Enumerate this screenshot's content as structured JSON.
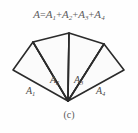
{
  "figure": {
    "caption": "(c)",
    "background_color": "#fefefe",
    "stroke_color": "#2b2b2b",
    "fill_color": "#fbfbfb",
    "text_color": "#5a5a5a"
  },
  "equation": {
    "full_text": "A=A1+A2+A3+A4",
    "lhs": "A",
    "equals": "=",
    "terms": [
      {
        "base": "A",
        "sub": "1"
      },
      {
        "base": "A",
        "sub": "2"
      },
      {
        "base": "A",
        "sub": "3"
      },
      {
        "base": "A",
        "sub": "4"
      }
    ],
    "plus": "+"
  },
  "regions": [
    {
      "base": "A",
      "sub": "1",
      "name": "triangle-a1"
    },
    {
      "base": "A",
      "sub": "2",
      "name": "triangle-a2"
    },
    {
      "base": "A",
      "sub": "3",
      "name": "triangle-a3"
    },
    {
      "base": "A",
      "sub": "4",
      "name": "triangle-a4"
    }
  ],
  "geometry": {
    "apex": "68,77",
    "vertices": {
      "left": "13,46",
      "upper_left": "33,18",
      "top": "69,9",
      "upper_right": "104,20",
      "right": "124,46"
    },
    "triangles": [
      {
        "id": "A1",
        "points": "68,77 13,46 33,18"
      },
      {
        "id": "A2",
        "points": "68,77 33,18 69,9"
      },
      {
        "id": "A3",
        "points": "68,77 69,9 104,20"
      },
      {
        "id": "A4",
        "points": "68,77 104,20 124,46"
      }
    ]
  }
}
